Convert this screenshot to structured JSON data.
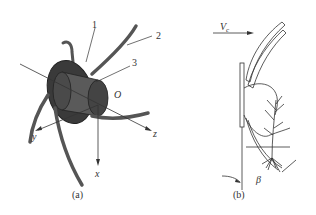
{
  "figure": {
    "panel_a": {
      "caption": "(a)",
      "part_labels": [
        "1",
        "2",
        "3"
      ],
      "axes": {
        "x": "x",
        "y": "y",
        "z": "z",
        "origin": "O"
      }
    },
    "panel_b": {
      "caption": "(b)",
      "velocity_label": "V",
      "velocity_subscript": "c",
      "angle_label": "β"
    }
  },
  "colors": {
    "ink": "#333333",
    "disc_dark": "#3a3a3a",
    "hub_mid": "#5a5a5a",
    "tine": "#555555",
    "background": "#ffffff"
  }
}
